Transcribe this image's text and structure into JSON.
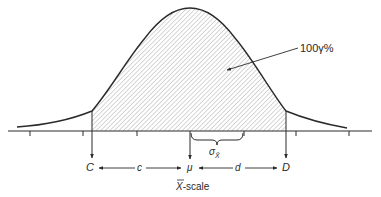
{
  "figure": {
    "type": "normal-distribution-confidence-interval",
    "shaded_region_label": "100γ%",
    "lower_limit_label": "C",
    "upper_limit_label": "D",
    "mean_label": "μ",
    "left_distance_label": "c",
    "right_distance_label": "d",
    "sigma_label": "σ",
    "sigma_subscript": "X̄",
    "axis_label_symbol": "X",
    "axis_label_suffix": "-scale",
    "colors": {
      "line": "#2a2a2a",
      "hatch": "#8a8a8a",
      "background": "#ffffff"
    }
  }
}
